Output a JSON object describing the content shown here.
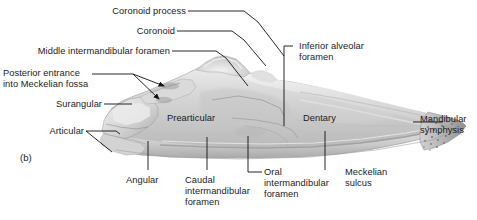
{
  "figure": {
    "panel_letter": "(b)",
    "background_color": "#ffffff",
    "text_color": "#1b1b1b",
    "leader_color": "#111111",
    "bone_light": "#e6e6e6",
    "bone_mid": "#cfcfcf",
    "bone_dark": "#9a9a9a",
    "bone_shadow": "#7d7d7d"
  },
  "labels": {
    "coronoid_process": "Coronoid process",
    "coronoid": "Coronoid",
    "middle_intermandibular_foramen": "Middle intermandibular foramen",
    "posterior_entrance": "Posterior entrance\ninto Meckelian fossa",
    "posterior_entrance_line1": "Posterior entrance",
    "posterior_entrance_line2": "into Meckelian fossa",
    "surangular": "Surangular",
    "articular": "Articular",
    "prearticular": "Prearticular",
    "angular": "Angular",
    "caudal_intermandibular_foramen_line1": "Caudal",
    "caudal_intermandibular_foramen_line2": "intermandibular",
    "caudal_intermandibular_foramen_line3": "foramen",
    "oral_intermandibular_foramen_line1": "Oral",
    "oral_intermandibular_foramen_line2": "intermandibular",
    "oral_intermandibular_foramen_line3": "foramen",
    "inferior_alveolar_foramen_line1": "Inferior alveolar",
    "inferior_alveolar_foramen_line2": "foramen",
    "dentary": "Dentary",
    "meckelian_sulcus_line1": "Meckelian",
    "meckelian_sulcus_line2": "sulcus",
    "mandibular_symphysis_line1": "Mandibular",
    "mandibular_symphysis_line2": "symphysis"
  }
}
